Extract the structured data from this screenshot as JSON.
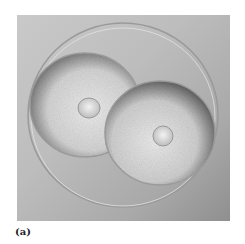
{
  "figure": {
    "panel_label": "(a)",
    "colors": {
      "background": "#ffffff",
      "photo_base": "#bdbdbd",
      "cell_light": "#e6e6e6",
      "cell_shadow": "#5a5a5a",
      "membrane": "#9a9a9a"
    }
  }
}
